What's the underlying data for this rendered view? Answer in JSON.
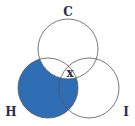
{
  "diagram": {
    "type": "venn-3",
    "labels": {
      "top": "C",
      "left": "H",
      "right": "I"
    },
    "mark": "x",
    "colors": {
      "shade": "#2f6db5",
      "stroke": "#555555",
      "label": "#2c2c4a"
    },
    "shaded_regions": [
      "H only",
      "H∩I not C"
    ],
    "marked_region": "on H boundary within C∩I"
  }
}
